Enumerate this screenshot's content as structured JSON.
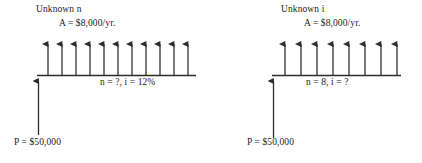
{
  "figure": {
    "type": "cash-flow-diagram-pair",
    "background_color": "#ffffff",
    "line_color": "#2b2b2b"
  },
  "diagrams": [
    {
      "id": "left",
      "title": "Unknown n",
      "annuity_label": "A = $8,000/yr.",
      "timeline_label": "n = ?, i = 12%",
      "principal_label": "P = $50,000",
      "arrow_count": 11,
      "interest_rate": "12%",
      "periods": "?",
      "annuity_amount": "$8,000",
      "principal_amount": "$50,000",
      "timeline": {
        "x_start": 37,
        "x_end": 196,
        "y": 75
      },
      "arrow_xs": [
        48,
        62,
        76,
        90,
        104,
        118,
        132,
        146,
        160,
        174,
        188
      ],
      "arrow_top_y": 38,
      "principal_arrow": {
        "x": 38,
        "y_top": 75,
        "y_bottom": 135
      }
    },
    {
      "id": "right",
      "title": "Unknown i",
      "annuity_label": "A = $8,000/yr.",
      "timeline_label": "n = 8, i = ?",
      "principal_label": "P = $50,000",
      "arrow_count": 8,
      "interest_rate": "?",
      "periods": "8",
      "annuity_amount": "$8,000",
      "principal_amount": "$50,000",
      "timeline": {
        "x_start": 272,
        "x_end": 401,
        "y": 75
      },
      "arrow_xs": [
        285,
        301,
        317,
        333,
        349,
        365,
        381,
        397
      ],
      "arrow_top_y": 38,
      "principal_arrow": {
        "x": 273,
        "y_top": 75,
        "y_bottom": 138
      }
    }
  ]
}
